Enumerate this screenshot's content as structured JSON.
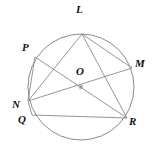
{
  "figure": {
    "type": "circle-geometry-diagram",
    "canvas": {
      "width": 158,
      "height": 156
    },
    "background_color": "#ffffff",
    "stroke_color": "#8a8a8a",
    "label_color": "#111111",
    "center_dot_color": "#8a8a8a",
    "circle": {
      "cx": 81,
      "cy": 87,
      "r": 53
    },
    "center_point": {
      "name": "O",
      "x": 81,
      "cy": 87,
      "y": 87
    },
    "points": [
      {
        "name": "L",
        "x": 82,
        "y": 34,
        "label_x": 76,
        "label_y": 4
      },
      {
        "name": "P",
        "x": 35,
        "y": 57,
        "label_x": 22,
        "label_y": 42
      },
      {
        "name": "M",
        "x": 132,
        "y": 68,
        "label_x": 135,
        "label_y": 58
      },
      {
        "name": "O",
        "x": 81,
        "y": 87,
        "label_x": 76,
        "label_y": 66
      },
      {
        "name": "N",
        "x": 28,
        "y": 101,
        "label_x": 12,
        "label_y": 99
      },
      {
        "name": "Q",
        "x": 32,
        "y": 115,
        "label_x": 18,
        "label_y": 114
      },
      {
        "name": "R",
        "x": 127,
        "y": 118,
        "label_x": 129,
        "label_y": 116
      }
    ],
    "segments": [
      {
        "name": "chord-L-N",
        "from": "L",
        "to": "N",
        "x1": 82,
        "y1": 34,
        "x2": 28,
        "y2": 101
      },
      {
        "name": "chord-L-M",
        "from": "L",
        "to": "M",
        "x1": 82,
        "y1": 34,
        "x2": 132,
        "y2": 68
      },
      {
        "name": "diameter-L-R",
        "from": "L",
        "to": "R",
        "x1": 82,
        "y1": 34,
        "x2": 127,
        "y2": 118
      },
      {
        "name": "chord-P-N",
        "from": "P",
        "to": "N",
        "x1": 35,
        "y1": 57,
        "x2": 28,
        "y2": 101
      },
      {
        "name": "diameter-P-R",
        "from": "P",
        "to": "R",
        "x1": 35,
        "y1": 57,
        "x2": 127,
        "y2": 118
      },
      {
        "name": "diameter-N-M",
        "from": "N",
        "to": "M",
        "x1": 28,
        "y1": 101,
        "x2": 132,
        "y2": 68
      },
      {
        "name": "chord-N-Q",
        "from": "N",
        "to": "Q",
        "x1": 28,
        "y1": 101,
        "x2": 32,
        "y2": 115
      },
      {
        "name": "chord-Q-R",
        "from": "Q",
        "to": "R",
        "x1": 32,
        "y1": 115,
        "x2": 127,
        "y2": 118
      }
    ]
  }
}
